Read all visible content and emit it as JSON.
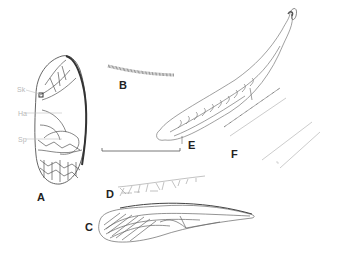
{
  "figure": {
    "panels": [
      {
        "id": "A",
        "label": "A",
        "description": "forewing (tegmen) with reticulate venation"
      },
      {
        "id": "B",
        "label": "B",
        "description": "stridulatory file"
      },
      {
        "id": "C",
        "label": "C",
        "description": "hind wing"
      },
      {
        "id": "D",
        "label": "D",
        "description": "vein detail with cross-veins"
      },
      {
        "id": "E",
        "label": "E",
        "description": "elongate wing/leg segment with cross-veins"
      },
      {
        "id": "F",
        "label": "F",
        "description": "vein fragments"
      }
    ],
    "annotations": [
      {
        "id": "sk",
        "label": "Sk"
      },
      {
        "id": "ha",
        "label": "Ha"
      },
      {
        "id": "sp",
        "label": "Sp"
      }
    ],
    "scale_bar": {
      "label": ""
    },
    "colors": {
      "line": "#4a4a4a",
      "light_line": "#a0a0a0",
      "label": "#222222",
      "annotation": "#b8b8b8",
      "background": "#ffffff"
    }
  }
}
